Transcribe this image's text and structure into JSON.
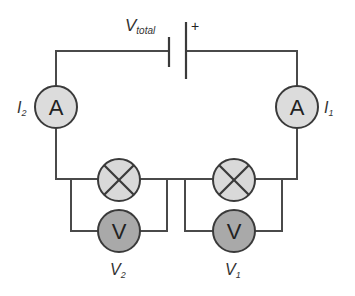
{
  "diagram": {
    "colors": {
      "wire": "#4a4a4a",
      "ammeter_fill": "#dcdcdc",
      "bulb_fill": "#d9d9d9",
      "voltmeter_fill": "#a9a9a9",
      "outline": "#3a3a3a"
    },
    "battery": {
      "label_main": "V",
      "label_sub": "total",
      "polarity": "+"
    },
    "ammeters": [
      {
        "id": "ammeter-left",
        "symbol": "A",
        "label_main": "I",
        "label_sub": "2"
      },
      {
        "id": "ammeter-right",
        "symbol": "A",
        "label_main": "I",
        "label_sub": "1"
      }
    ],
    "bulbs": [
      {
        "id": "bulb-left",
        "icon": "lamp-cross-icon"
      },
      {
        "id": "bulb-right",
        "icon": "lamp-cross-icon"
      }
    ],
    "voltmeters": [
      {
        "id": "voltmeter-left",
        "symbol": "V",
        "label_main": "V",
        "label_sub": "2"
      },
      {
        "id": "voltmeter-right",
        "symbol": "V",
        "label_main": "V",
        "label_sub": "1"
      }
    ]
  }
}
